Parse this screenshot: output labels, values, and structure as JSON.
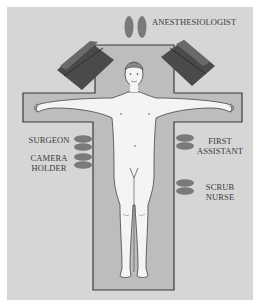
{
  "diagram": {
    "colors": {
      "background": "#d6d6d6",
      "table": "#bdbdbd",
      "table_outline": "#3a3a3a",
      "monitor": "#4a4a4a",
      "feet": "#7a7a7a",
      "body": "#f4f4f2",
      "text": "#3a3a3a"
    },
    "labels": {
      "anesthesiologist": "ANESTHESIOLOGIST",
      "surgeon": "SURGEON",
      "camera_holder_line1": "CAMERA",
      "camera_holder_line2": "HOLDER",
      "first_assistant_line1": "FIRST",
      "first_assistant_line2": "ASSISTANT",
      "scrub_nurse_line1": "SCRUB",
      "scrub_nurse_line2": "NURSE"
    },
    "positions": [
      {
        "role": "Anesthesiologist",
        "location": "head of table"
      },
      {
        "role": "Surgeon",
        "location": "patient's right, upper"
      },
      {
        "role": "Camera Holder",
        "location": "patient's right, lower"
      },
      {
        "role": "First Assistant",
        "location": "patient's left, upper"
      },
      {
        "role": "Scrub Nurse",
        "location": "patient's left, lower"
      }
    ],
    "equipment": [
      {
        "name": "monitor-left",
        "location": "upper-left of head"
      },
      {
        "name": "monitor-right",
        "location": "upper-right of head"
      }
    ]
  }
}
